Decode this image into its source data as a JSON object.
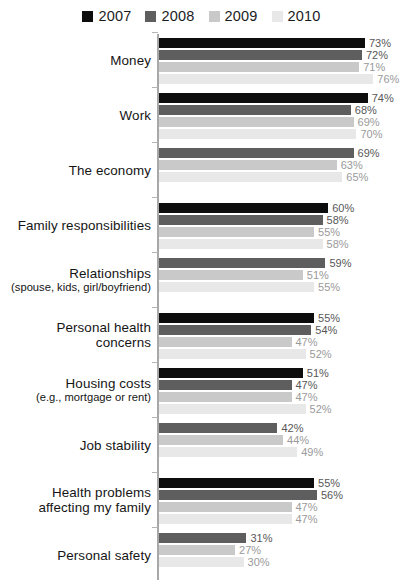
{
  "legend": {
    "position": "top-center",
    "entries": [
      {
        "label": "2007",
        "color": "#0d0d0d"
      },
      {
        "label": "2008",
        "color": "#5e5e5e"
      },
      {
        "label": "2009",
        "color": "#c9c9c9"
      },
      {
        "label": "2010",
        "color": "#e8e8e8"
      }
    ]
  },
  "chart_data": {
    "type": "bar",
    "orientation": "horizontal",
    "title": "",
    "subtitle": "",
    "xlabel": "",
    "ylabel": "",
    "xlim": [
      0,
      80
    ],
    "grid": false,
    "value_suffix": "%",
    "legend_position": "top-center",
    "series": [
      {
        "name": "2007",
        "color": "#0d0d0d",
        "values": [
          73,
          74,
          null,
          60,
          null,
          55,
          51,
          null,
          55,
          null
        ]
      },
      {
        "name": "2008",
        "color": "#5e5e5e",
        "values": [
          72,
          68,
          69,
          58,
          59,
          54,
          47,
          42,
          56,
          31
        ]
      },
      {
        "name": "2009",
        "color": "#c9c9c9",
        "values": [
          71,
          69,
          63,
          55,
          51,
          47,
          47,
          44,
          47,
          27
        ]
      },
      {
        "name": "2010",
        "color": "#e8e8e8",
        "values": [
          76,
          70,
          65,
          58,
          55,
          52,
          52,
          49,
          47,
          30
        ]
      }
    ],
    "categories": [
      "Money",
      "Work",
      "The economy",
      "Family responsibilities",
      "Relationships",
      "Personal health concerns",
      "Housing costs",
      "Job stability",
      "Health problems affecting my family",
      "Personal safety"
    ],
    "category_labels": [
      {
        "main": "Money",
        "sub": ""
      },
      {
        "main": "Work",
        "sub": ""
      },
      {
        "main": "The economy",
        "sub": ""
      },
      {
        "main": "Family responsibilities",
        "sub": ""
      },
      {
        "main": "Relationships",
        "sub": "(spouse, kids, girl/boyfriend)"
      },
      {
        "main": "Personal health\nconcerns",
        "sub": ""
      },
      {
        "main": "Housing costs",
        "sub": "(e.g., mortgage or rent)"
      },
      {
        "main": "Job stability",
        "sub": ""
      },
      {
        "main": "Health problems\naffecting my family",
        "sub": ""
      },
      {
        "main": "Personal safety",
        "sub": ""
      }
    ],
    "data_labels": [
      {
        "category": "Money",
        "points": [
          {
            "series": "2007",
            "value": "73%"
          },
          {
            "series": "2008",
            "value": "72%"
          },
          {
            "series": "2009",
            "value": "71%"
          },
          {
            "series": "2010",
            "value": "76%"
          }
        ]
      },
      {
        "category": "Work",
        "points": [
          {
            "series": "2007",
            "value": "74%"
          },
          {
            "series": "2008",
            "value": "68%"
          },
          {
            "series": "2009",
            "value": "69%"
          },
          {
            "series": "2010",
            "value": "70%"
          }
        ]
      },
      {
        "category": "The economy",
        "points": [
          {
            "series": "2008",
            "value": "69%"
          },
          {
            "series": "2009",
            "value": "63%"
          },
          {
            "series": "2010",
            "value": "65%"
          }
        ]
      },
      {
        "category": "Family responsibilities",
        "points": [
          {
            "series": "2007",
            "value": "60%"
          },
          {
            "series": "2008",
            "value": "58%"
          },
          {
            "series": "2009",
            "value": "55%"
          },
          {
            "series": "2010",
            "value": "58%"
          }
        ]
      },
      {
        "category": "Relationships",
        "points": [
          {
            "series": "2008",
            "value": "59%"
          },
          {
            "series": "2009",
            "value": "51%"
          },
          {
            "series": "2010",
            "value": "55%"
          }
        ]
      },
      {
        "category": "Personal health concerns",
        "points": [
          {
            "series": "2007",
            "value": "55%"
          },
          {
            "series": "2008",
            "value": "54%"
          },
          {
            "series": "2009",
            "value": "47%"
          },
          {
            "series": "2010",
            "value": "52%"
          }
        ]
      },
      {
        "category": "Housing costs",
        "points": [
          {
            "series": "2007",
            "value": "51%"
          },
          {
            "series": "2008",
            "value": "47%"
          },
          {
            "series": "2009",
            "value": "47%"
          },
          {
            "series": "2010",
            "value": "52%"
          }
        ]
      },
      {
        "category": "Job stability",
        "points": [
          {
            "series": "2008",
            "value": "42%"
          },
          {
            "series": "2009",
            "value": "44%"
          },
          {
            "series": "2010",
            "value": "49%"
          }
        ]
      },
      {
        "category": "Health problems affecting my family",
        "points": [
          {
            "series": "2007",
            "value": "55%"
          },
          {
            "series": "2008",
            "value": "56%"
          },
          {
            "series": "2009",
            "value": "47%"
          },
          {
            "series": "2010",
            "value": "47%"
          }
        ]
      },
      {
        "category": "Personal safety",
        "points": [
          {
            "series": "2008",
            "value": "31%"
          },
          {
            "series": "2009",
            "value": "27%"
          },
          {
            "series": "2010",
            "value": "30%"
          }
        ]
      }
    ]
  },
  "render": {
    "px_per_percent": 2.82,
    "axis_color": "#a8a8a8"
  }
}
